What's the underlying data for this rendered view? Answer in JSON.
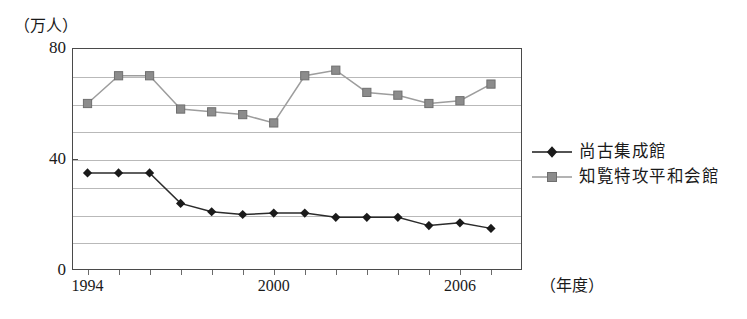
{
  "chart_data": {
    "type": "line",
    "title": "",
    "subtitle": "",
    "xlabel": "（年度）",
    "ylabel": "（万人）",
    "x": [
      1994,
      1995,
      1996,
      1997,
      1998,
      1999,
      2000,
      2001,
      2002,
      2003,
      2004,
      2005,
      2006,
      2007
    ],
    "xlim": [
      1993.5,
      2008.0
    ],
    "ylim": [
      0,
      80
    ],
    "ytick_labels": [
      "0",
      "40",
      "80"
    ],
    "ytick_values": [
      0,
      40,
      80
    ],
    "xtick_labels": [
      "1994",
      "2000",
      "2006"
    ],
    "xtick_values": [
      1994,
      2000,
      2006
    ],
    "gridlines": [
      10,
      20,
      30,
      40,
      50,
      60,
      70
    ],
    "grid": true,
    "legend_position": "right",
    "series": [
      {
        "name": "尚古集成館",
        "marker": "diamond",
        "color": "#1a1a1a",
        "values": [
          35,
          35,
          35,
          24,
          21,
          20,
          20.5,
          20.5,
          19,
          19,
          19,
          16,
          17,
          15
        ]
      },
      {
        "name": "知覧特攻平和会館",
        "marker": "square",
        "color": "#8c8c8c",
        "values": [
          60,
          70,
          70,
          58,
          57,
          56,
          53,
          70,
          72,
          64,
          63,
          60,
          61,
          67
        ]
      }
    ]
  },
  "axis": {
    "y_unit_caption": "（万人）",
    "x_unit_caption": "（年度）"
  },
  "legend": {
    "items": [
      {
        "label": "尚古集成館"
      },
      {
        "label": "知覧特攻平和会館"
      }
    ]
  }
}
